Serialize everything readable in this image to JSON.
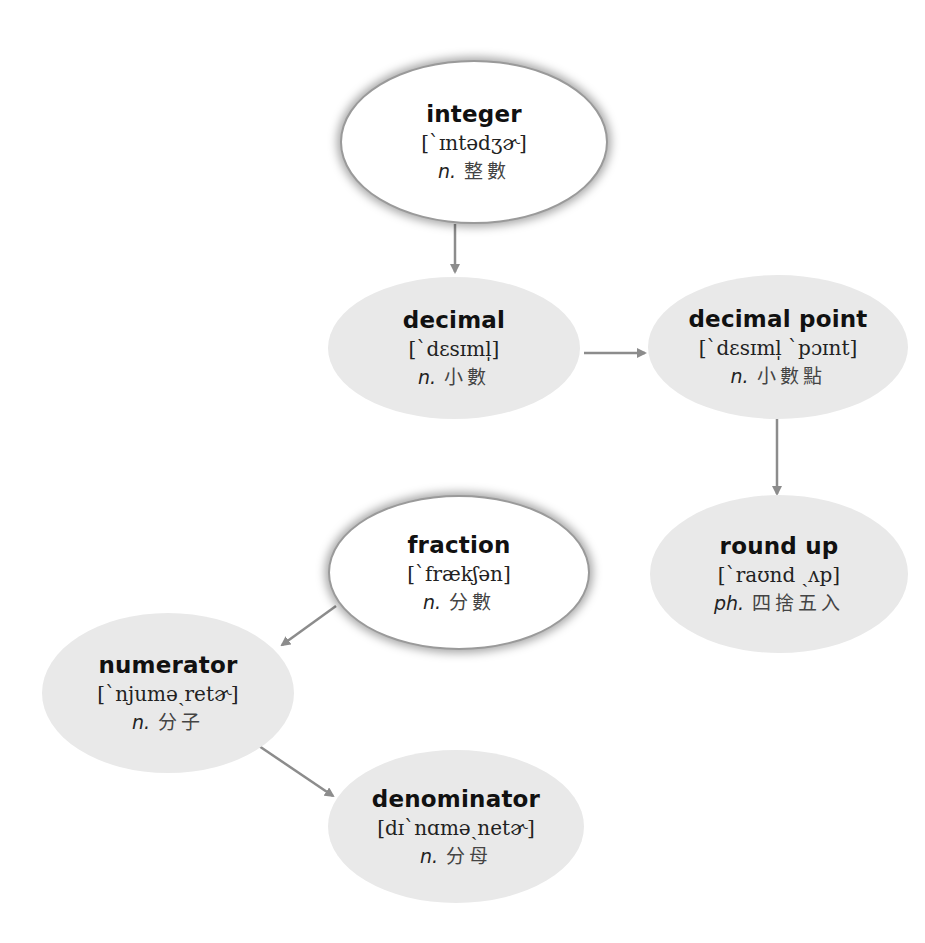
{
  "diagram": {
    "type": "vocabulary-concept-map",
    "colors": {
      "root_fill": "#ffffff",
      "child_fill": "#e9e9e9",
      "arrow": "#8c8c8c",
      "text": "#111111"
    },
    "nodes": [
      {
        "id": "integer",
        "term": "integer",
        "ipa": "[`ɪntədʒɚ]",
        "pos": "n.",
        "zh": "整數",
        "style": "white"
      },
      {
        "id": "decimal",
        "term": "decimal",
        "ipa": "[`dɛsɪml̩]",
        "pos": "n.",
        "zh": "小數",
        "style": "gray"
      },
      {
        "id": "decimal_point",
        "term": "decimal point",
        "ipa": "[`dɛsɪml̩ `pɔɪnt]",
        "pos": "n.",
        "zh": "小數點",
        "style": "gray"
      },
      {
        "id": "round_up",
        "term": "round up",
        "ipa": "[`raʊnd ˏʌp]",
        "pos": "ph.",
        "zh": "四捨五入",
        "style": "gray"
      },
      {
        "id": "fraction",
        "term": "fraction",
        "ipa": "[`frækʃən]",
        "pos": "n.",
        "zh": "分數",
        "style": "white"
      },
      {
        "id": "numerator",
        "term": "numerator",
        "ipa": "[`njuməˏretɚ]",
        "pos": "n.",
        "zh": "分子",
        "style": "gray"
      },
      {
        "id": "denominator",
        "term": "denominator",
        "ipa": "[dɪ`nɑməˏnetɚ]",
        "pos": "n.",
        "zh": "分母",
        "style": "gray"
      }
    ],
    "edges": [
      {
        "from": "integer",
        "to": "decimal"
      },
      {
        "from": "decimal",
        "to": "decimal_point"
      },
      {
        "from": "decimal_point",
        "to": "round_up"
      },
      {
        "from": "fraction",
        "to": "numerator"
      },
      {
        "from": "numerator",
        "to": "denominator"
      }
    ]
  }
}
